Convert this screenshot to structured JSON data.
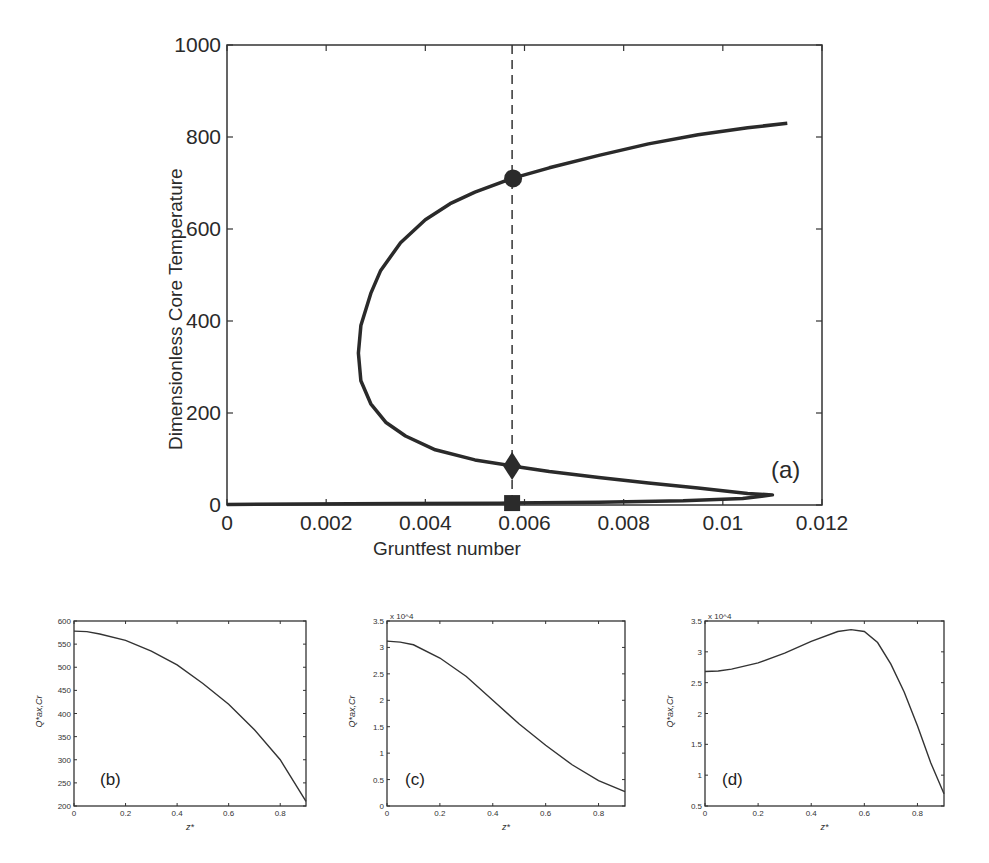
{
  "chart_data": [
    {
      "id": "a",
      "type": "line",
      "panel_label": "(a)",
      "title": "",
      "xlabel": "Gruntfest number",
      "ylabel": "Dimensionless Core Temperature",
      "xlim": [
        0,
        0.012
      ],
      "ylim": [
        0,
        1000
      ],
      "xticks": [
        0,
        0.002,
        0.004,
        0.006,
        0.008,
        0.01,
        0.012
      ],
      "xtick_labels": [
        "0",
        "0.002",
        "0.004",
        "0.006",
        "0.008",
        "0.01",
        "0.012"
      ],
      "yticks": [
        0,
        200,
        400,
        600,
        800,
        1000
      ],
      "ytick_labels": [
        "0",
        "200",
        "400",
        "600",
        "800",
        "1000"
      ],
      "grid": false,
      "series": [
        {
          "name": "steady-state branch (S-curve)",
          "x": [
            0.0113,
            0.0105,
            0.0095,
            0.0085,
            0.0075,
            0.0065,
            0.00575,
            0.005,
            0.0045,
            0.004,
            0.0035,
            0.0031,
            0.0029,
            0.0027,
            0.00265,
            0.0027,
            0.0029,
            0.0032,
            0.0036,
            0.0042,
            0.005,
            0.00575,
            0.0065,
            0.0075,
            0.0085,
            0.0095,
            0.0105,
            0.011,
            0.0104,
            0.0092,
            0.0075,
            0.0055,
            0.0035,
            0.0015,
            0.0
          ],
          "y": [
            830,
            820,
            805,
            785,
            760,
            733,
            710,
            680,
            655,
            620,
            570,
            510,
            460,
            390,
            330,
            270,
            220,
            180,
            150,
            120,
            98,
            85,
            73,
            60,
            48,
            37,
            25,
            22,
            14,
            9,
            6,
            4,
            3,
            2,
            1
          ]
        }
      ],
      "markers": [
        {
          "shape": "circle",
          "x": 0.00575,
          "y": 710,
          "label": "upper solution"
        },
        {
          "shape": "diamond",
          "x": 0.00575,
          "y": 85,
          "label": "middle solution"
        },
        {
          "shape": "square",
          "x": 0.00575,
          "y": 2,
          "label": "lower solution"
        }
      ],
      "vline": {
        "x": 0.00575,
        "style": "dashed"
      }
    },
    {
      "id": "b",
      "type": "line",
      "panel_label": "(b)",
      "xlabel": "z*",
      "ylabel": "Q*ax,Cr",
      "xlim": [
        0,
        0.9
      ],
      "ylim": [
        200,
        600
      ],
      "xticks": [
        0,
        0.2,
        0.4,
        0.6,
        0.8
      ],
      "xtick_labels": [
        "0",
        "0.2",
        "0.4",
        "0.6",
        "0.8"
      ],
      "yticks": [
        200,
        250,
        300,
        350,
        400,
        450,
        500,
        550,
        600
      ],
      "ytick_labels": [
        "200",
        "250",
        "300",
        "350",
        "400",
        "450",
        "500",
        "550",
        "600"
      ],
      "series": [
        {
          "name": "profile",
          "x": [
            0,
            0.05,
            0.1,
            0.2,
            0.3,
            0.4,
            0.5,
            0.6,
            0.7,
            0.8,
            0.9
          ],
          "y": [
            578,
            577,
            572,
            558,
            535,
            505,
            465,
            420,
            365,
            300,
            210
          ]
        }
      ]
    },
    {
      "id": "c",
      "type": "line",
      "panel_label": "(c)",
      "xlabel": "z*",
      "ylabel": "Q*ax,Cr",
      "exponent_label": "x 10^4",
      "xlim": [
        0,
        0.9
      ],
      "ylim": [
        0,
        3.5
      ],
      "xticks": [
        0,
        0.2,
        0.4,
        0.6,
        0.8
      ],
      "xtick_labels": [
        "0",
        "0.2",
        "0.4",
        "0.6",
        "0.8"
      ],
      "yticks": [
        0,
        0.5,
        1,
        1.5,
        2,
        2.5,
        3,
        3.5
      ],
      "ytick_labels": [
        "0",
        "0.5",
        "1",
        "1.5",
        "2",
        "2.5",
        "3",
        "3.5"
      ],
      "series": [
        {
          "name": "profile",
          "x": [
            0,
            0.05,
            0.1,
            0.2,
            0.3,
            0.4,
            0.5,
            0.6,
            0.7,
            0.8,
            0.9
          ],
          "y": [
            3.12,
            3.1,
            3.05,
            2.8,
            2.45,
            2.0,
            1.55,
            1.15,
            0.78,
            0.48,
            0.27
          ]
        }
      ]
    },
    {
      "id": "d",
      "type": "line",
      "panel_label": "(d)",
      "xlabel": "z*",
      "ylabel": "Q*ax,Cr",
      "exponent_label": "x 10^4",
      "xlim": [
        0,
        0.9
      ],
      "ylim": [
        0.5,
        3.5
      ],
      "xticks": [
        0,
        0.2,
        0.4,
        0.6,
        0.8
      ],
      "xtick_labels": [
        "0",
        "0.2",
        "0.4",
        "0.6",
        "0.8"
      ],
      "yticks": [
        0.5,
        1,
        1.5,
        2,
        2.5,
        3,
        3.5
      ],
      "ytick_labels": [
        "0.5",
        "1",
        "1.5",
        "2",
        "2.5",
        "3",
        "3.5"
      ],
      "series": [
        {
          "name": "profile",
          "x": [
            0,
            0.05,
            0.1,
            0.2,
            0.3,
            0.4,
            0.5,
            0.55,
            0.6,
            0.65,
            0.7,
            0.75,
            0.8,
            0.85,
            0.9
          ],
          "y": [
            2.68,
            2.69,
            2.72,
            2.82,
            2.98,
            3.17,
            3.33,
            3.36,
            3.33,
            3.15,
            2.8,
            2.35,
            1.8,
            1.2,
            0.7
          ]
        }
      ]
    }
  ]
}
